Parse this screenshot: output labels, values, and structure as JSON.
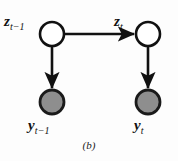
{
  "figure": {
    "caption": "(b)",
    "background_color": "#fdfdfd",
    "stroke_color": "#111111",
    "observed_fill_color": "#8e8e8e",
    "latent_fill_color": "#ffffff"
  },
  "nodes": [
    {
      "id": "z-prev",
      "kind": "latent",
      "label_main": "z",
      "label_sub": "t−1",
      "cx": 52,
      "cy": 34,
      "r": 12
    },
    {
      "id": "z-cur",
      "kind": "latent",
      "label_main": "z",
      "label_sub": "t",
      "cx": 148,
      "cy": 34,
      "r": 12
    },
    {
      "id": "y-prev",
      "kind": "observed",
      "label_main": "y",
      "label_sub": "t−1",
      "cx": 52,
      "cy": 102,
      "r": 12
    },
    {
      "id": "y-cur",
      "kind": "observed",
      "label_main": "y",
      "label_sub": "t",
      "cx": 148,
      "cy": 102,
      "r": 12
    }
  ],
  "edges": [
    {
      "id": "edge-z-prev-to-z-cur",
      "from": "z-prev",
      "to": "z-cur",
      "direction": "horizontal"
    },
    {
      "id": "edge-z-prev-to-y-prev",
      "from": "z-prev",
      "to": "y-prev",
      "direction": "vertical"
    },
    {
      "id": "edge-z-cur-to-y-cur",
      "from": "z-cur",
      "to": "y-cur",
      "direction": "vertical"
    }
  ]
}
